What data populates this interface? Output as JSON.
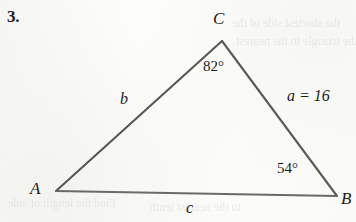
{
  "page": {
    "width": 356,
    "height": 222,
    "background_color": "#fdfdfc",
    "ink_color": "#1c1c1c",
    "line_color": "#575757"
  },
  "problem": {
    "number": "3."
  },
  "figure": {
    "type": "triangle",
    "vertices": [
      {
        "name": "A",
        "label": "A",
        "x": 56,
        "y": 191,
        "label_x": 30,
        "label_y": 180
      },
      {
        "name": "B",
        "label": "B",
        "x": 337,
        "y": 196,
        "label_x": 341,
        "label_y": 190
      },
      {
        "name": "C",
        "label": "C",
        "x": 222,
        "y": 41,
        "label_x": 213,
        "label_y": 10
      }
    ],
    "sides": [
      {
        "name": "a",
        "label": "a = 16",
        "opposite_vertex": "A",
        "from": "C",
        "to": "B",
        "value": "16",
        "label_x": 287,
        "label_y": 88
      },
      {
        "name": "b",
        "label": "b",
        "opposite_vertex": "B",
        "from": "A",
        "to": "C",
        "value": "",
        "label_x": 120,
        "label_y": 91
      },
      {
        "name": "c",
        "label": "c",
        "opposite_vertex": "C",
        "from": "A",
        "to": "B",
        "value": "",
        "label_x": 186,
        "label_y": 200
      }
    ],
    "angles": [
      {
        "at_vertex": "C",
        "label": "82°",
        "value": 82,
        "label_x": 203,
        "label_y": 59
      },
      {
        "at_vertex": "B",
        "label": "54°",
        "value": 54,
        "label_x": 277,
        "label_y": 161
      }
    ]
  },
  "artifacts": {
    "bleed_through": [
      {
        "name": "ghost-top-right-1",
        "text": "the shortest side of the"
      },
      {
        "name": "ghost-top-right-2",
        "text": "the triangle to the nearest"
      },
      {
        "name": "ghost-bottom-left-1",
        "text": "Find the length of side"
      },
      {
        "name": "ghost-bottom-left-2",
        "text": "to the nearest tenth"
      }
    ]
  }
}
